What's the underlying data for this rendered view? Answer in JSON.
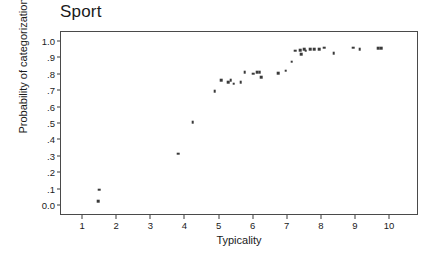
{
  "chart_data": {
    "type": "scatter",
    "title": "Sport",
    "xlabel": "Typicality",
    "ylabel": "Probability of categorization",
    "xlim": [
      0.35,
      10.85
    ],
    "ylim": [
      -0.06,
      1.06
    ],
    "grid": false,
    "legend": null,
    "x_ticks": [
      1,
      2,
      3,
      4,
      5,
      6,
      7,
      8,
      9,
      10
    ],
    "x_tick_labels": [
      "1",
      "2",
      "3",
      "4",
      "5",
      "6",
      "7",
      "8",
      "9",
      "10"
    ],
    "y_ticks": [
      0.0,
      0.1,
      0.2,
      0.3,
      0.4,
      0.5,
      0.6,
      0.7,
      0.8,
      0.9,
      1.0
    ],
    "y_tick_labels": [
      "0.0",
      ".1",
      ".2",
      ".3",
      ".4",
      ".5",
      ".6",
      ".7",
      ".8",
      ".9",
      "1.0"
    ],
    "marker": "square",
    "marker_color": "#3a3a3a",
    "points": [
      {
        "x": 1.47,
        "y": 0.1
      },
      {
        "x": 1.44,
        "y": 0.03
      },
      {
        "x": 3.78,
        "y": 0.32
      },
      {
        "x": 4.21,
        "y": 0.51
      },
      {
        "x": 4.86,
        "y": 0.7
      },
      {
        "x": 5.05,
        "y": 0.765
      },
      {
        "x": 5.26,
        "y": 0.755
      },
      {
        "x": 5.33,
        "y": 0.765
      },
      {
        "x": 5.41,
        "y": 0.745
      },
      {
        "x": 5.62,
        "y": 0.755
      },
      {
        "x": 5.74,
        "y": 0.815
      },
      {
        "x": 5.99,
        "y": 0.805
      },
      {
        "x": 6.11,
        "y": 0.815
      },
      {
        "x": 6.18,
        "y": 0.815
      },
      {
        "x": 6.22,
        "y": 0.785
      },
      {
        "x": 6.72,
        "y": 0.81
      },
      {
        "x": 6.94,
        "y": 0.825
      },
      {
        "x": 7.12,
        "y": 0.88
      },
      {
        "x": 7.22,
        "y": 0.945
      },
      {
        "x": 7.36,
        "y": 0.95
      },
      {
        "x": 7.4,
        "y": 0.925
      },
      {
        "x": 7.48,
        "y": 0.955
      },
      {
        "x": 7.53,
        "y": 0.945
      },
      {
        "x": 7.66,
        "y": 0.955
      },
      {
        "x": 7.78,
        "y": 0.955
      },
      {
        "x": 7.93,
        "y": 0.955
      },
      {
        "x": 8.07,
        "y": 0.965
      },
      {
        "x": 8.35,
        "y": 0.93
      },
      {
        "x": 8.92,
        "y": 0.965
      },
      {
        "x": 9.11,
        "y": 0.955
      },
      {
        "x": 9.66,
        "y": 0.96
      },
      {
        "x": 9.75,
        "y": 0.96
      }
    ]
  }
}
